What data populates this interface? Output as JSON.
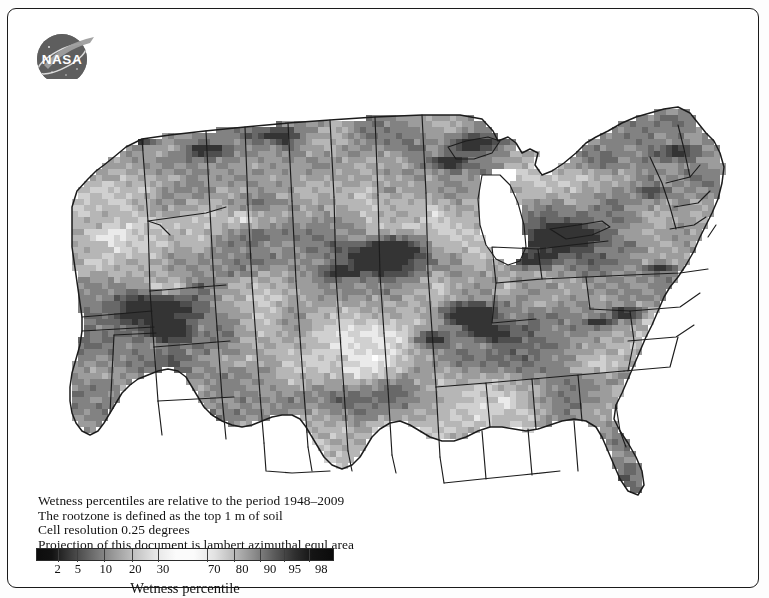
{
  "figure": {
    "logo": {
      "name": "nasa-meatball-logo",
      "wordmark": "NASA"
    },
    "caption_lines": [
      "Wetness percentiles are relative to the period 1948–2009",
      "The rootzone is defined as the top 1 m of soil",
      "Cell resolution 0.25 degrees",
      "Projection of this document is lambert azimuthal equl area"
    ],
    "colorbar": {
      "axis_label": "Wetness percentile",
      "tick_labels": [
        "2",
        "5",
        "10",
        "20",
        "30",
        "70",
        "80",
        "90",
        "95",
        "98"
      ],
      "tick_positions_pct": [
        7.0,
        13.5,
        22.5,
        32.0,
        41.0,
        57.5,
        66.5,
        75.5,
        83.5,
        92.0
      ],
      "gradient_description": "dark-to-light-to-dark grayscale",
      "endpoint_colors": [
        "#0d0d0d",
        "#fbfbfb",
        "#0b0b0b"
      ]
    },
    "map": {
      "title_alt": "US rootzone soil wetness percentile map",
      "region": "Contiguous United States",
      "colors": {
        "background": "#ffffff",
        "border": "#1a1a1a",
        "state_outline": "#1c1c1c"
      }
    }
  },
  "chart_data": {
    "type": "heatmap",
    "xlabel": "",
    "ylabel": "",
    "colorbar_label": "Wetness percentile",
    "colorbar_ticks": [
      2,
      5,
      10,
      20,
      30,
      70,
      80,
      90,
      95,
      98
    ],
    "value_range": [
      0,
      100
    ],
    "cell_resolution_degrees": 0.25,
    "reference_period": "1948–2009",
    "projection": "lambert azimuthal equal area",
    "colormap": "grayscale diverging (dark low, white mid, dark high)",
    "grid": false,
    "legend_position": "bottom-left",
    "notes": [
      "Very dark (high-percentile wet) clusters over Arizona/Sonoran region, central Great Plains (Kansas/Nebraska), lower Mississippi valley, and upper Great Lakes / Minnesota.",
      "Broad light (mid-percentile) coverage across Texas, the Southeast and Florida.",
      "Moderate-dark banding through the Pacific Northwest interior (Oregon/Idaho)."
    ]
  }
}
